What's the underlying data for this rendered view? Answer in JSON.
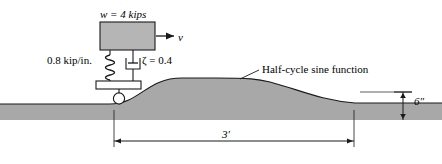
{
  "figure": {
    "labels": {
      "weight": "w = 4 kips",
      "velocity": "v",
      "stiffness": "0.8 kip/in.",
      "damping_ratio": "ζ = 0.4",
      "bump_callout": "Half-cycle sine function",
      "bump_height": "6″",
      "bump_length": "3′"
    },
    "colors": {
      "mass_fill": "#b5b5b5",
      "ground_fill": "#a8a8a8",
      "stroke": "#1a1a1a",
      "background": "#ffffff"
    },
    "geometry": {
      "mass_block": {
        "x": 100,
        "y": 22,
        "width": 55,
        "height": 28
      },
      "base_plate": {
        "x": 96,
        "y": 81,
        "width": 45,
        "height": 8
      },
      "wheel": {
        "cx": 119,
        "cy": 98,
        "r": 6
      },
      "ground_flat_y": 104,
      "bump_peak_y": 78,
      "bump_start_x": 110,
      "bump_end_x": 355,
      "dimension_line_y": 141
    },
    "elements": {
      "mass": "mass-block",
      "spring": "coil-spring",
      "damper": "dashpot",
      "wheel": "wheel-circle",
      "ground": "ground-profile",
      "velocity_arrow": "velocity-arrow",
      "height_dimension": "height-dimension",
      "length_dimension": "length-dimension",
      "leader_line": "callout-leader-line"
    }
  }
}
